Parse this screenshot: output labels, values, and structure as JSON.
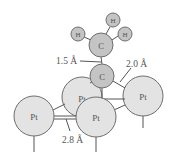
{
  "diagram": {
    "colors": {
      "carbon_fill": "#c4c4c4",
      "hydrogen_fill": "#c4c4c4",
      "platinum_fill": "#e3e3e3",
      "stroke": "#6e6e6e",
      "bond": "#555555",
      "text": "#555555"
    },
    "atoms": [
      {
        "id": "h-left",
        "element": "H",
        "label": "H",
        "cx": 78,
        "cy": 34,
        "r": 7
      },
      {
        "id": "h-top",
        "element": "H",
        "label": "H",
        "cx": 113,
        "cy": 20,
        "r": 7
      },
      {
        "id": "h-right",
        "element": "H",
        "label": "H",
        "cx": 125,
        "cy": 34,
        "r": 7
      },
      {
        "id": "c-methyl",
        "element": "C",
        "label": "C",
        "cx": 101,
        "cy": 45,
        "r": 12
      },
      {
        "id": "c-bottom",
        "element": "C",
        "label": "C",
        "cx": 102,
        "cy": 76,
        "r": 12
      },
      {
        "id": "pt-back",
        "element": "Pt",
        "label": "Pt",
        "cx": 82,
        "cy": 97,
        "r": 20
      },
      {
        "id": "pt-right",
        "element": "Pt",
        "label": "Pt",
        "cx": 143,
        "cy": 96,
        "r": 20
      },
      {
        "id": "pt-left",
        "element": "Pt",
        "label": "Pt",
        "cx": 34,
        "cy": 116,
        "r": 20
      },
      {
        "id": "pt-front",
        "element": "Pt",
        "label": "Pt",
        "cx": 96,
        "cy": 117,
        "r": 20
      }
    ],
    "annotations": {
      "cc_bond": "1.5 Å",
      "cpt_bond": "2.0 Å",
      "ptpt_distance": "2.8 Å"
    }
  }
}
